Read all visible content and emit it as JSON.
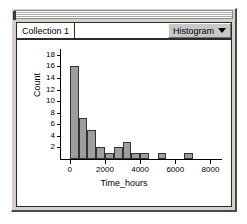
{
  "window": {
    "title_bar_name": "window-grab-bar"
  },
  "tab_strip": {
    "collection_tab_label": "Collection 1",
    "plot_type_label": "Histogram",
    "menu_arrow_icon": "chevron-down-icon"
  },
  "chart_data": {
    "type": "bar",
    "title": "",
    "subtitle": "",
    "xlabel": "Time_hours",
    "ylabel": "Count",
    "xlim": [
      -500,
      8600
    ],
    "ylim": [
      0,
      19
    ],
    "grid": false,
    "legend": false,
    "bin_width": 500,
    "xticks": [
      0,
      2000,
      4000,
      6000,
      8000
    ],
    "xtick_labels": [
      "0",
      "2000",
      "4000",
      "6000",
      "8000"
    ],
    "yticks": [
      2,
      4,
      6,
      8,
      10,
      12,
      14,
      16,
      18
    ],
    "ytick_labels": [
      "2",
      "4",
      "6",
      "8",
      "10",
      "12",
      "14",
      "16",
      "18"
    ],
    "bins": [
      {
        "x0": 0,
        "x1": 500,
        "value": 16
      },
      {
        "x0": 500,
        "x1": 1000,
        "value": 7
      },
      {
        "x0": 1000,
        "x1": 1500,
        "value": 5
      },
      {
        "x0": 1500,
        "x1": 2000,
        "value": 2
      },
      {
        "x0": 2000,
        "x1": 2500,
        "value": 1
      },
      {
        "x0": 2500,
        "x1": 3000,
        "value": 2
      },
      {
        "x0": 3000,
        "x1": 3500,
        "value": 3
      },
      {
        "x0": 3500,
        "x1": 4000,
        "value": 1
      },
      {
        "x0": 4000,
        "x1": 4500,
        "value": 1
      },
      {
        "x0": 5000,
        "x1": 5500,
        "value": 1
      },
      {
        "x0": 6500,
        "x1": 7000,
        "value": 1
      }
    ],
    "categories": [
      "0-500",
      "500-1000",
      "1000-1500",
      "1500-2000",
      "2000-2500",
      "2500-3000",
      "3000-3500",
      "3500-4000",
      "4000-4500",
      "5000-5500",
      "6500-7000"
    ],
    "values": [
      16,
      7,
      5,
      2,
      1,
      2,
      3,
      1,
      1,
      1,
      1
    ],
    "colors": {
      "bar_fill": "#9e9e9e",
      "bar_stroke": "#333333",
      "axis": "#000000"
    }
  }
}
